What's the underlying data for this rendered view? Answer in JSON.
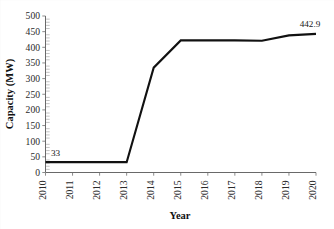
{
  "chart_data": {
    "type": "line",
    "title": "",
    "xlabel": "Year",
    "ylabel": "Capacity (MW)",
    "x": [
      2010,
      2011,
      2012,
      2013,
      2014,
      2015,
      2016,
      2017,
      2018,
      2019,
      2020
    ],
    "xtick_labels": [
      "2010",
      "2011",
      "2012",
      "2013",
      "2014",
      "2015",
      "2016",
      "2017",
      "2018",
      "2019",
      "2020"
    ],
    "series": [
      {
        "name": "Capacity",
        "values": [
          33,
          33,
          33,
          33,
          335,
          422,
          422,
          422,
          421,
          438,
          442.9
        ],
        "color": "#111111"
      }
    ],
    "ylim": [
      0,
      500
    ],
    "ytick_labels": [
      "0",
      "50",
      "100",
      "150",
      "200",
      "250",
      "300",
      "350",
      "400",
      "450",
      "500"
    ],
    "ytick_values": [
      0,
      50,
      100,
      150,
      200,
      250,
      300,
      350,
      400,
      450,
      500
    ],
    "grid": false,
    "legend": false,
    "legend_position": "none",
    "annotations": [
      {
        "text": "33",
        "x": 2010,
        "y": 33,
        "name": "first-point-label"
      },
      {
        "text": "442.9",
        "x": 2020,
        "y": 442.9,
        "name": "last-point-label"
      }
    ],
    "minor_ticks_per_interval": 5,
    "line_color": "#111111",
    "axis_color": "#585858"
  }
}
